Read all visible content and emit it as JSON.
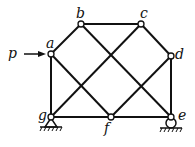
{
  "diagram": {
    "type": "truss",
    "nodes": {
      "a": {
        "label": "a",
        "x": 51,
        "y": 54
      },
      "b": {
        "label": "b",
        "x": 81,
        "y": 24
      },
      "c": {
        "label": "c",
        "x": 141,
        "y": 24
      },
      "d": {
        "label": "d",
        "x": 171,
        "y": 56
      },
      "e": {
        "label": "e",
        "x": 171,
        "y": 117
      },
      "f": {
        "label": "f",
        "x": 111,
        "y": 117
      },
      "g": {
        "label": "g",
        "x": 51,
        "y": 117
      }
    },
    "members": [
      [
        "a",
        "b"
      ],
      [
        "b",
        "c"
      ],
      [
        "c",
        "d"
      ],
      [
        "d",
        "e"
      ],
      [
        "e",
        "f"
      ],
      [
        "f",
        "g"
      ],
      [
        "g",
        "a"
      ],
      [
        "a",
        "f"
      ],
      [
        "b",
        "e"
      ],
      [
        "g",
        "c"
      ],
      [
        "f",
        "d"
      ]
    ],
    "load": {
      "label": "p",
      "node": "a",
      "direction": "right"
    },
    "supports": {
      "g": "pin",
      "e": "roller"
    },
    "colors": {
      "line": "#111111",
      "background": "#ffffff"
    }
  }
}
